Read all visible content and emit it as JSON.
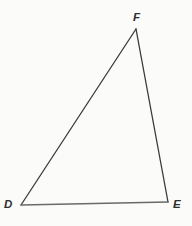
{
  "figure": {
    "name": "Triangle DEF",
    "background_color": "#fbfbfa",
    "stroke_color": "#3a3a3a",
    "label_color": "#2e2e2e",
    "vertices": [
      {
        "id": "D",
        "label": "D",
        "x": 21,
        "y": 205,
        "label_x": 4,
        "label_y": 199
      },
      {
        "id": "E",
        "label": "E",
        "x": 168,
        "y": 202,
        "label_x": 173,
        "label_y": 199
      },
      {
        "id": "F",
        "label": "F",
        "x": 136,
        "y": 29,
        "label_x": 133,
        "label_y": 12
      }
    ],
    "edges": [
      {
        "id": "DF",
        "from": "D",
        "to": "F",
        "color": "#3a3a3a",
        "width": 1.3
      },
      {
        "id": "FE",
        "from": "F",
        "to": "E",
        "color": "#3a3a3a",
        "width": 1.3
      },
      {
        "id": "DE",
        "from": "D",
        "to": "E",
        "color": "#6a6a6a",
        "width": 1.5
      }
    ]
  }
}
